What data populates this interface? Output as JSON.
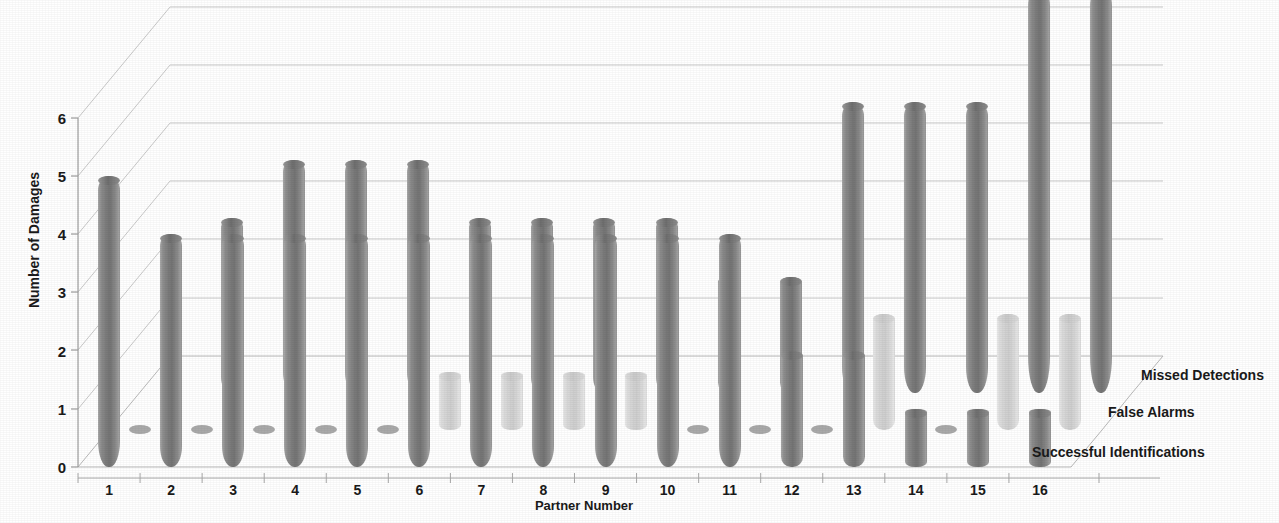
{
  "chart_data": {
    "type": "bar",
    "subtype": "3d-clustered-cylinder",
    "title": "",
    "xlabel": "Partner Number",
    "ylabel": "Number of Damages",
    "categories": [
      "1",
      "2",
      "3",
      "4",
      "5",
      "6",
      "7",
      "8",
      "9",
      "10",
      "11",
      "12",
      "13",
      "14",
      "15",
      "16"
    ],
    "yticks": [
      "0",
      "1",
      "2",
      "3",
      "4",
      "5",
      "6"
    ],
    "ylim": [
      0,
      7
    ],
    "grid": true,
    "legend_position": "depth-axis-right",
    "series": [
      {
        "name": "Successful Identifications",
        "color": "#7b7b7b",
        "values": [
          5,
          4,
          4,
          4,
          4,
          4,
          4,
          4,
          4,
          4,
          4,
          2,
          2,
          1,
          1,
          1
        ]
      },
      {
        "name": "False Alarms",
        "color": "#d2d2d2",
        "values": [
          0,
          0,
          0,
          0,
          0,
          1,
          1,
          1,
          1,
          0,
          0,
          0,
          2,
          0,
          2,
          2
        ]
      },
      {
        "name": "Missed Detections",
        "color": "#7b7b7b",
        "values": [
          0,
          3,
          4,
          4,
          4,
          3,
          3,
          3,
          3,
          2,
          2,
          5,
          5,
          5,
          7,
          7
        ]
      }
    ]
  },
  "axes": {
    "y_title": "Number of Damages",
    "x_title": "Partner Number"
  }
}
